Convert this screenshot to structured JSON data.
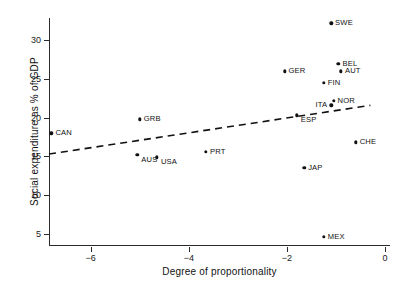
{
  "chart_data": {
    "type": "scatter",
    "title": "",
    "xlabel": "Degree of proportionality",
    "ylabel": "Social expenditure as % of GDP",
    "xlim": [
      -6.85,
      0.1
    ],
    "ylim": [
      3.4,
      32.9
    ],
    "xticks": [
      -6,
      -4,
      -2,
      0
    ],
    "xtick_labels": [
      "−6",
      "−4",
      "−2",
      "0"
    ],
    "yticks": [
      5,
      10,
      15,
      20,
      25,
      30
    ],
    "ytick_labels": [
      "5",
      "10",
      "15",
      "20",
      "25",
      "30"
    ],
    "grid": false,
    "legend": false,
    "point_color": "#111111",
    "axis_color": "#2b2b2b",
    "points": [
      {
        "label": "CAN",
        "x": -6.8,
        "y": 18.0,
        "label_pos": "right"
      },
      {
        "label": "SWE",
        "x": -1.1,
        "y": 32.2,
        "label_pos": "right"
      },
      {
        "label": "BEL",
        "x": -0.95,
        "y": 27.0,
        "label_pos": "right"
      },
      {
        "label": "AUT",
        "x": -0.9,
        "y": 26.0,
        "label_pos": "right"
      },
      {
        "label": "GER",
        "x": -2.05,
        "y": 26.0,
        "label_pos": "right"
      },
      {
        "label": "FIN",
        "x": -1.25,
        "y": 24.5,
        "label_pos": "right"
      },
      {
        "label": "NOR",
        "x": -1.05,
        "y": 22.2,
        "label_pos": "right"
      },
      {
        "label": "ITA",
        "x": -1.1,
        "y": 21.6,
        "label_pos": "left"
      },
      {
        "label": "ESP",
        "x": -1.8,
        "y": 20.3,
        "label_pos": "right-below"
      },
      {
        "label": "GRB",
        "x": -5.0,
        "y": 19.8,
        "label_pos": "right"
      },
      {
        "label": "CHE",
        "x": -0.6,
        "y": 16.8,
        "label_pos": "right"
      },
      {
        "label": "PRT",
        "x": -3.65,
        "y": 15.6,
        "label_pos": "right"
      },
      {
        "label": "AUS",
        "x": -5.05,
        "y": 15.2,
        "label_pos": "right-below"
      },
      {
        "label": "USA",
        "x": -4.65,
        "y": 14.9,
        "label_pos": "right-below"
      },
      {
        "label": "JAP",
        "x": -1.65,
        "y": 13.5,
        "label_pos": "right"
      },
      {
        "label": "MEX",
        "x": -1.25,
        "y": 4.6,
        "label_pos": "right"
      }
    ],
    "trend_line": {
      "style": "dashed",
      "color": "#111111",
      "x0": -6.85,
      "y0": 15.3,
      "x1": -0.3,
      "y1": 21.6
    }
  }
}
